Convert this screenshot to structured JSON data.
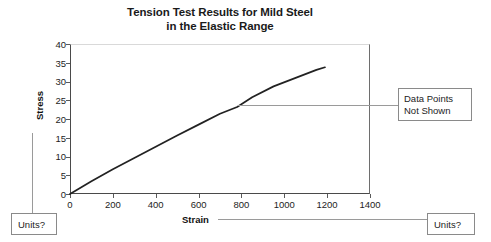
{
  "chart_data": {
    "type": "line",
    "title": "Tension Test Results for Mild Steel in the Elastic Range",
    "title_lines": [
      "Tension Test Results for Mild Steel",
      "in the Elastic Range"
    ],
    "xlabel": "Strain",
    "ylabel": "Stress",
    "xlim": [
      0,
      1400
    ],
    "ylim": [
      0,
      40
    ],
    "xticks": [
      0,
      200,
      400,
      600,
      800,
      1000,
      1200,
      1400
    ],
    "yticks": [
      0,
      5,
      10,
      15,
      20,
      25,
      30,
      35,
      40
    ],
    "xtick_labels": [
      "0",
      "200",
      "400",
      "600",
      "800",
      "1000",
      "1200",
      "1400"
    ],
    "ytick_labels": [
      "0",
      "5",
      "10",
      "15",
      "20",
      "25",
      "30",
      "35",
      "40"
    ],
    "grid": false,
    "legend": false,
    "series": [
      {
        "name": "Stress-strain curve",
        "color": "#222222",
        "x": [
          0,
          100,
          200,
          300,
          400,
          500,
          600,
          700,
          780,
          850,
          950,
          1050,
          1150,
          1190
        ],
        "y": [
          0,
          3.4,
          6.6,
          9.6,
          12.6,
          15.6,
          18.5,
          21.4,
          23.2,
          25.8,
          28.7,
          30.9,
          33.1,
          33.8
        ]
      }
    ],
    "annotations": [
      {
        "name": "data-points-not-shown",
        "text_lines": [
          "Data Points",
          "Not Shown"
        ],
        "attach_x": 800,
        "attach_y": 23.2
      },
      {
        "name": "units-question-y-axis",
        "text": "Units?"
      },
      {
        "name": "units-question-x-axis",
        "text": "Units?"
      }
    ]
  },
  "callouts": {
    "data_points_line1": "Data Points",
    "data_points_line2": "Not Shown",
    "units_left": "Units?",
    "units_right": "Units?"
  },
  "colors": {
    "curve": "#222222",
    "axis": "#4a4a4a",
    "leader": "#9a9a9a",
    "callout_border": "#8a8a8a",
    "text": "#1d1d1d",
    "background": "#ffffff"
  }
}
